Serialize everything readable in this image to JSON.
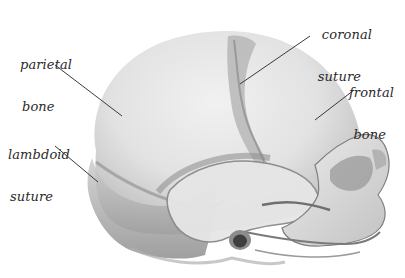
{
  "figure": {
    "colors": {
      "background": "#ffffff",
      "bone_light": "#e9e9e9",
      "bone_mid": "#c9c9c9",
      "bone_dark": "#8d8d8d",
      "suture": "#a8a8a8",
      "leader_line": "#3a3a3a",
      "label_text": "#2a2a2a"
    },
    "labels": [
      {
        "id": "parietal-bone",
        "line1": "parietal",
        "line2": "bone"
      },
      {
        "id": "lambdoid-suture",
        "line1": "lambdoid",
        "line2": "suture"
      },
      {
        "id": "coronal-suture",
        "line1": "coronal",
        "line2": "suture"
      },
      {
        "id": "frontal-bone",
        "line1": "frontal",
        "line2": "bone"
      }
    ]
  }
}
